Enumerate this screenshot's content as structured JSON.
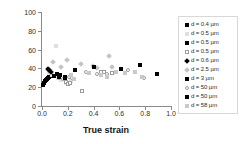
{
  "chart_data": {
    "type": "scatter",
    "title": "",
    "xlabel": "True strain",
    "ylabel_line1": "Apparent activation",
    "ylabel_line2": "volume V*, b",
    "ylabel_exponent": "3",
    "xlim": [
      0.0,
      1.0
    ],
    "ylim": [
      0,
      100
    ],
    "xticks": [
      "0.0",
      "0.2",
      "0.4",
      "0.6",
      "0.8",
      "1.0"
    ],
    "xtick_values": [
      0.0,
      0.2,
      0.4,
      0.6,
      0.8,
      1.0
    ],
    "yticks": [
      "0",
      "20",
      "40",
      "60",
      "80",
      "100"
    ],
    "ytick_values": [
      0,
      20,
      40,
      60,
      80,
      100
    ],
    "grid": false,
    "legend_position": "right-outside",
    "series": [
      {
        "name": "d = 0.4 µm",
        "marker": "m-sq-fill",
        "points": [
          [
            0.01,
            22
          ],
          [
            0.015,
            25
          ],
          [
            0.022,
            27
          ],
          [
            0.03,
            28
          ],
          [
            0.038,
            29
          ],
          [
            0.046,
            30
          ],
          [
            0.055,
            31
          ],
          [
            0.065,
            32
          ]
        ]
      },
      {
        "name": "d = 0.5 µm",
        "marker": "m-sq-lgray",
        "points": [
          [
            0.055,
            35
          ],
          [
            0.075,
            33
          ],
          [
            0.105,
            64
          ],
          [
            0.125,
            30
          ],
          [
            0.15,
            28
          ],
          [
            0.185,
            25
          ],
          [
            0.205,
            24
          ],
          [
            0.225,
            27
          ]
        ]
      },
      {
        "name": "d = 0.5 µm",
        "marker": "m-sq-fill",
        "points": [
          [
            0.09,
            32
          ],
          [
            0.115,
            34
          ],
          [
            0.14,
            33
          ],
          [
            0.175,
            31
          ]
        ]
      },
      {
        "name": "d = 0.5 µm",
        "marker": "m-sq-open",
        "points": [
          [
            0.185,
            26
          ],
          [
            0.205,
            23
          ],
          [
            0.22,
            25
          ],
          [
            0.31,
            16
          ],
          [
            0.455,
            36
          ],
          [
            0.48,
            36
          ],
          [
            0.545,
            35
          ]
        ]
      },
      {
        "name": "d = 0.6 µm",
        "marker": "m-dia-fill",
        "points": [
          [
            0.048,
            39
          ],
          [
            0.058,
            38
          ],
          [
            0.07,
            36
          ]
        ]
      },
      {
        "name": "d = 2.5 µm",
        "marker": "m-dia-gray",
        "points": [
          [
            0.085,
            47
          ],
          [
            0.15,
            42
          ],
          [
            0.19,
            49
          ],
          [
            0.3,
            45
          ],
          [
            0.395,
            43
          ],
          [
            0.43,
            40
          ],
          [
            0.52,
            53
          ],
          [
            0.545,
            42
          ]
        ]
      },
      {
        "name": "d = 3 µm",
        "marker": "m-sq-fill",
        "points": [
          [
            0.255,
            38
          ],
          [
            0.4,
            41
          ],
          [
            0.615,
            39
          ],
          [
            0.76,
            44
          ],
          [
            0.895,
            34
          ]
        ]
      },
      {
        "name": "d = 50 µm",
        "marker": "m-ci-open",
        "points": [
          [
            0.13,
            30
          ],
          [
            0.165,
            29
          ],
          [
            0.21,
            31
          ],
          [
            0.235,
            30
          ],
          [
            0.34,
            36
          ],
          [
            0.43,
            34
          ],
          [
            0.5,
            34
          ],
          [
            0.665,
            38
          ],
          [
            0.79,
            30
          ]
        ]
      },
      {
        "name": "d = 50 µm",
        "marker": "m-sq-fill",
        "points": [
          [
            0.128,
            31
          ],
          [
            0.175,
            30
          ]
        ]
      },
      {
        "name": "d = 58 µm",
        "marker": "m-sq-gray",
        "points": [
          [
            0.225,
            33
          ],
          [
            0.25,
            29
          ],
          [
            0.365,
            35
          ],
          [
            0.46,
            33
          ],
          [
            0.5,
            31
          ],
          [
            0.57,
            36
          ],
          [
            0.64,
            35
          ],
          [
            0.72,
            36
          ],
          [
            0.775,
            31
          ]
        ]
      }
    ]
  }
}
